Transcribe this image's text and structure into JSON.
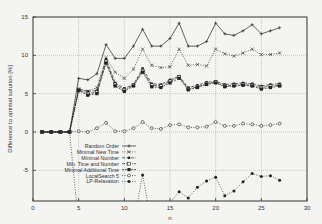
{
  "chart_data": {
    "type": "line",
    "title": "",
    "xlabel": "n",
    "ylabel": "Difference to optimal solution [%]",
    "xlim": [
      0,
      30
    ],
    "ylim": [
      -9,
      15
    ],
    "xticks": [
      0,
      5,
      10,
      15,
      20,
      25,
      30
    ],
    "yticks": [
      -5,
      0,
      5,
      10,
      15
    ],
    "grid": true,
    "legend_position": "center-left",
    "x": [
      1,
      2,
      3,
      4,
      5,
      6,
      7,
      8,
      9,
      10,
      11,
      12,
      13,
      14,
      15,
      16,
      17,
      18,
      19,
      20,
      21,
      22,
      23,
      24,
      25,
      26,
      27
    ],
    "series": [
      {
        "name": "Random Order",
        "style": "solid",
        "marker": "plus",
        "values": [
          0,
          0,
          0,
          0,
          7.0,
          6.8,
          7.6,
          11.4,
          9.6,
          9.6,
          11.2,
          13.4,
          11.2,
          11.2,
          12.2,
          14.2,
          11.2,
          11.2,
          11.8,
          14.2,
          12.8,
          12.6,
          13.2,
          14.0,
          12.8,
          13.2,
          13.6
        ]
      },
      {
        "name": "Minimal New Time",
        "style": "dotted",
        "marker": "x",
        "values": [
          0,
          0,
          0,
          0,
          5.6,
          5.3,
          5.8,
          9.7,
          7.8,
          7.0,
          8.2,
          10.8,
          8.7,
          8.4,
          8.5,
          10.8,
          8.7,
          8.8,
          8.6,
          10.8,
          10.2,
          9.9,
          10.3,
          10.8,
          10.1,
          10.1,
          10.3
        ]
      },
      {
        "name": "Minimal Number",
        "style": "dashed",
        "marker": "asterisk",
        "values": [
          0,
          0,
          0,
          0,
          5.6,
          5.3,
          5.4,
          9.5,
          6.4,
          5.7,
          6.2,
          8.3,
          6.3,
          6.2,
          6.8,
          7.3,
          5.8,
          6.1,
          6.5,
          6.6,
          6.2,
          6.3,
          6.4,
          6.3,
          6.0,
          6.2,
          6.3
        ]
      },
      {
        "name": "Min. Time and Number",
        "style": "dash-dot",
        "marker": "open-square",
        "values": [
          0,
          0,
          0,
          0,
          5.5,
          5.0,
          5.2,
          9.2,
          6.2,
          5.5,
          6.1,
          8.0,
          6.1,
          6.0,
          6.6,
          7.2,
          5.6,
          5.9,
          6.3,
          6.5,
          6.0,
          6.1,
          6.2,
          6.1,
          5.8,
          6.0,
          6.1
        ]
      },
      {
        "name": "Minimal Additional Time",
        "style": "dash",
        "marker": "filled-square",
        "values": [
          0,
          0,
          0,
          0,
          5.4,
          4.8,
          5.0,
          9.0,
          6.0,
          5.3,
          6.0,
          7.8,
          5.9,
          5.8,
          6.4,
          7.0,
          5.5,
          5.8,
          6.2,
          6.4,
          5.9,
          6.0,
          6.1,
          6.0,
          5.6,
          5.8,
          6.0
        ]
      },
      {
        "name": "LocalSearch 5",
        "style": "dotted",
        "marker": "open-circle",
        "values": [
          0,
          0,
          0,
          0,
          0.1,
          0,
          0.5,
          1.2,
          0.1,
          0.1,
          0.5,
          1.3,
          0.5,
          0.4,
          0.9,
          1.0,
          0.6,
          0.6,
          0.7,
          1.3,
          0.8,
          0.8,
          1.1,
          1.0,
          0.8,
          0.9,
          1.1
        ]
      },
      {
        "name": "LP-Relaxation",
        "style": "dotted",
        "marker": "filled-circle",
        "values": [
          0,
          0,
          0,
          0,
          -12,
          -12,
          -12,
          -12,
          -12,
          -12,
          -12,
          -5.6,
          -12,
          -12,
          -9.2,
          -7.8,
          -8.6,
          -7.2,
          -6.4,
          -5.9,
          -8.3,
          -7.7,
          -6.5,
          -5.4,
          -5.8,
          -5.7,
          -6.3
        ]
      }
    ]
  }
}
